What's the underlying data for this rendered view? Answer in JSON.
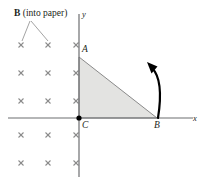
{
  "figure": {
    "width": 203,
    "height": 184,
    "background": "#ffffff"
  },
  "field_annotation": {
    "symbol": "B",
    "text": " (into paper)",
    "full_text": "B (into paper)",
    "x": 14,
    "y": 9,
    "leader_lines": [
      {
        "x1": 30,
        "y1": 21,
        "x2": 22,
        "y2": 41
      },
      {
        "x1": 31,
        "y1": 21,
        "x2": 48,
        "y2": 41
      }
    ]
  },
  "field_marks": {
    "glyph": "x",
    "color": "#8c8c8c",
    "size": 5,
    "columns_x": [
      21,
      48,
      76
    ],
    "rows_y": [
      45,
      73,
      101,
      135,
      163
    ],
    "count": 15
  },
  "axes": {
    "color": "#6d6e71",
    "origin": {
      "x": 79,
      "y": 118
    },
    "x_axis": {
      "x1": 8,
      "y1": 118,
      "x2": 193,
      "y2": 118,
      "label": "x",
      "label_x": 193,
      "label_y": 114
    },
    "y_axis": {
      "x1": 79,
      "y1": 14,
      "x2": 79,
      "y2": 177,
      "label": "y",
      "label_x": 82,
      "label_y": 10
    }
  },
  "triangle": {
    "fill": "#e3e3e1",
    "stroke": "#8a8a8a",
    "vertices": {
      "A": {
        "x": 79,
        "y": 57,
        "label": "A",
        "label_x": 82,
        "label_y": 45
      },
      "B": {
        "x": 157,
        "y": 118,
        "label": "B",
        "label_x": 154,
        "label_y": 121
      },
      "C": {
        "x": 79,
        "y": 118,
        "label": "C",
        "label_x": 82,
        "label_y": 121
      }
    }
  },
  "origin_dot": {
    "x": 79,
    "y": 118,
    "radius": 2.6,
    "color": "#000000"
  },
  "rotation_arrow": {
    "color": "#000000",
    "tail": {
      "x": 158,
      "y": 118
    },
    "control": {
      "x": 164,
      "y": 80
    },
    "tip": {
      "x": 147,
      "y": 62
    },
    "description": "curved arrow indicating rotation about B"
  }
}
